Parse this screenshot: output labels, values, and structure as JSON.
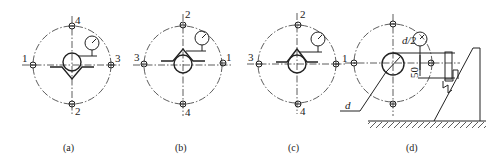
{
  "figure": {
    "panels": [
      {
        "id": "a",
        "caption": "(a)",
        "center": [
          72,
          65
        ],
        "labels": {
          "top": "4",
          "bottom": "2",
          "left": "1",
          "right": "3"
        },
        "vblock": "below"
      },
      {
        "id": "b",
        "caption": "(b)",
        "center": [
          183,
          65
        ],
        "labels": {
          "top": "2",
          "bottom": "4",
          "left": "3",
          "right": "1"
        },
        "vblock": "above"
      },
      {
        "id": "c",
        "caption": "(c)",
        "center": [
          297,
          64
        ],
        "labels": {
          "top": "2",
          "bottom": "4",
          "left": "3",
          "right": "1"
        },
        "vblock": "above"
      },
      {
        "id": "d",
        "caption": "(d)",
        "center": [
          393,
          63
        ],
        "annotations": {
          "diameter": "d",
          "half_diameter": "d/2",
          "offset": "50"
        }
      }
    ]
  }
}
